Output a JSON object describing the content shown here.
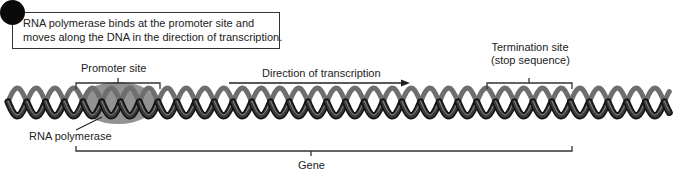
{
  "note": {
    "line1": "RNA polymerase binds at the promoter site and",
    "line2": "moves along the DNA in the direction of transcription."
  },
  "labels": {
    "promoter": "Promoter site",
    "direction": "Direction of transcription",
    "termination_line1": "Termination site",
    "termination_line2": "(stop sequence)",
    "rna_polymerase": "RNA polymerase",
    "gene": "Gene"
  },
  "colors": {
    "dna_strand": "#2a2a2a",
    "dna_highlight": "#8a8a8a",
    "polymerase": "#8c8c8c",
    "line": "#333333"
  }
}
